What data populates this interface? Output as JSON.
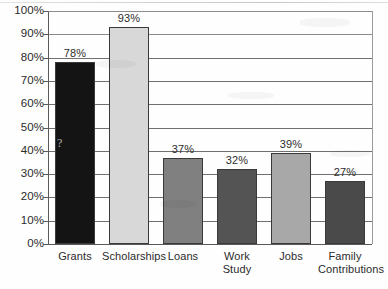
{
  "chart_data": {
    "type": "bar",
    "title": "",
    "subtitle": "",
    "xlabel": "",
    "ylabel": "",
    "categories": [
      "Grants",
      "Scholarships",
      "Loans",
      "Work Study",
      "Jobs",
      "Family Contributions"
    ],
    "values": [
      78,
      93,
      37,
      32,
      39,
      27
    ],
    "data_labels": [
      "78%",
      "93%",
      "37%",
      "32%",
      "39%",
      "27%"
    ],
    "ylim": [
      0,
      100
    ],
    "ytick_values": [
      0,
      10,
      20,
      30,
      40,
      50,
      60,
      70,
      80,
      90,
      100
    ],
    "ytick_labels": [
      "0%",
      "10%",
      "20%",
      "30%",
      "40%",
      "50%",
      "60%",
      "70%",
      "80%",
      "90%",
      "100%"
    ],
    "grid": true,
    "grid_axis": "y",
    "legend": false,
    "legend_position": "none",
    "bar_colors": [
      "#141414",
      "#d8d8d8",
      "#808080",
      "#545454",
      "#a8a8a8",
      "#4a4a4a"
    ],
    "bar_edge_color": "#3a3a3a",
    "axis_color": "#5a5a5a",
    "gridline_color": "#707070",
    "background_color": "#fefefe",
    "text_color": "#2b2b2b",
    "category_label_lines": [
      [
        "Grants"
      ],
      [
        "Scholarships"
      ],
      [
        "Loans"
      ],
      [
        "Work Study"
      ],
      [
        "Jobs"
      ],
      [
        "Family",
        "Contributions"
      ]
    ]
  },
  "artifacts": {
    "grants_bar_mark": "?"
  }
}
